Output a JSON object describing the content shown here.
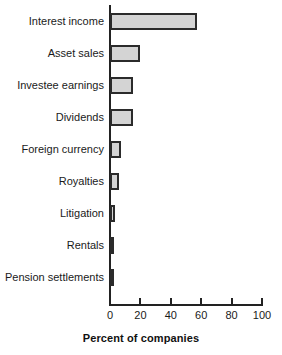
{
  "chart_data": {
    "type": "bar",
    "orientation": "horizontal",
    "title": "",
    "subtitle": "",
    "xlabel": "Percent of companies",
    "ylabel": "",
    "xlim": [
      0,
      100
    ],
    "xticks": [
      0,
      20,
      40,
      60,
      80,
      100
    ],
    "xticklabels": [
      "0",
      "20",
      "40",
      "60",
      "80",
      "100"
    ],
    "grid": false,
    "legend": null,
    "bar_fill_color": "#d4d4d4",
    "bar_edge_color": "#2b2b2b",
    "axis_color": "#222222",
    "categories": [
      "Interest income",
      "Asset sales",
      "Investee earnings",
      "Dividends",
      "Foreign currency",
      "Royalties",
      "Litigation",
      "Rentals",
      "Pension settlements"
    ],
    "values": [
      57,
      20,
      15,
      15,
      7,
      6,
      3,
      2,
      2
    ]
  }
}
